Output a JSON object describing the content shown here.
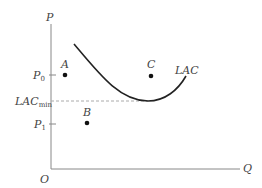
{
  "diagram": {
    "axes": {
      "y_label": "P",
      "x_label": "Q",
      "origin_label": "O"
    },
    "y_ticks": [
      {
        "label": "P",
        "sub": "0",
        "name": "p0"
      },
      {
        "label": "LAC",
        "sub": "min",
        "name": "lac-min"
      },
      {
        "label": "P",
        "sub": "1",
        "name": "p1"
      }
    ],
    "curve": {
      "label": "LAC"
    },
    "points": [
      {
        "label": "A"
      },
      {
        "label": "B"
      },
      {
        "label": "C"
      }
    ],
    "colors": {
      "axis": "#888888",
      "curve": "#222222",
      "dashed": "#aaaaaa",
      "text": "#444444"
    }
  }
}
